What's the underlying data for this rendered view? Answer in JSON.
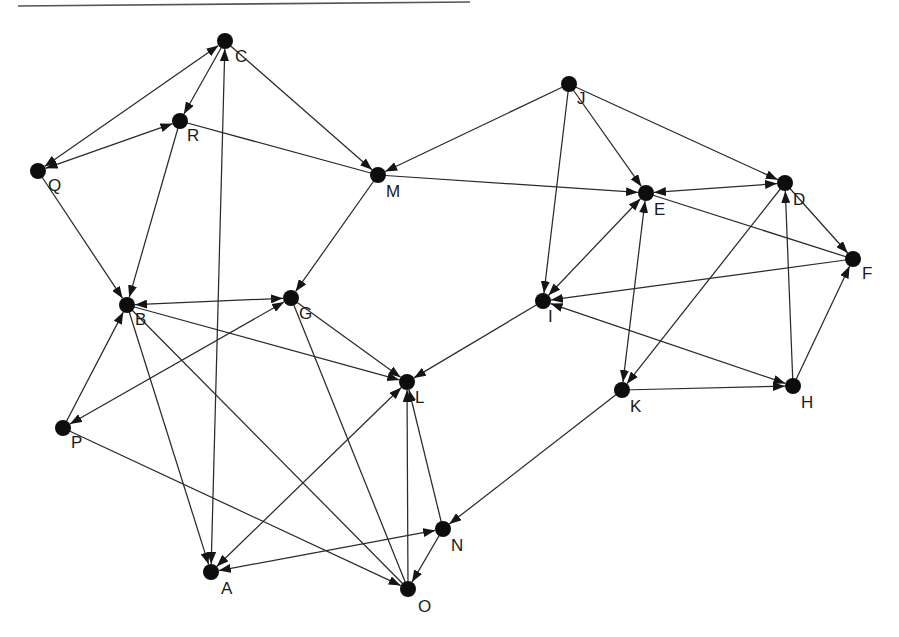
{
  "diagram": {
    "type": "directed-graph",
    "node_radius": 8,
    "colors": {
      "node": "#0d0d0d",
      "edge": "#2a2a2a",
      "label": "#1a1a1a",
      "background": "#ffffff"
    },
    "nodes": [
      {
        "id": "A",
        "label": "A",
        "x": 211,
        "y": 572,
        "lx": 221,
        "ly": 594
      },
      {
        "id": "B",
        "label": "B",
        "x": 127,
        "y": 305,
        "lx": 135,
        "ly": 325
      },
      {
        "id": "C",
        "label": "C",
        "x": 225,
        "y": 41,
        "lx": 235,
        "ly": 62
      },
      {
        "id": "D",
        "label": "D",
        "x": 785,
        "y": 183,
        "lx": 793,
        "ly": 205
      },
      {
        "id": "E",
        "label": "E",
        "x": 646,
        "y": 193,
        "lx": 654,
        "ly": 215
      },
      {
        "id": "F",
        "label": "F",
        "x": 853,
        "y": 259,
        "lx": 862,
        "ly": 279
      },
      {
        "id": "G",
        "label": "G",
        "x": 291,
        "y": 298,
        "lx": 299,
        "ly": 319
      },
      {
        "id": "H",
        "label": "H",
        "x": 793,
        "y": 386,
        "lx": 801,
        "ly": 408
      },
      {
        "id": "I",
        "label": "I",
        "x": 543,
        "y": 301,
        "lx": 548,
        "ly": 322
      },
      {
        "id": "J",
        "label": "J",
        "x": 569,
        "y": 84,
        "lx": 577,
        "ly": 104
      },
      {
        "id": "K",
        "label": "K",
        "x": 622,
        "y": 390,
        "lx": 630,
        "ly": 412
      },
      {
        "id": "L",
        "label": "L",
        "x": 407,
        "y": 382,
        "lx": 415,
        "ly": 403
      },
      {
        "id": "M",
        "label": "M",
        "x": 378,
        "y": 175,
        "lx": 386,
        "ly": 197
      },
      {
        "id": "N",
        "label": "N",
        "x": 443,
        "y": 529,
        "lx": 451,
        "ly": 551
      },
      {
        "id": "O",
        "label": "O",
        "x": 408,
        "y": 589,
        "lx": 418,
        "ly": 612
      },
      {
        "id": "P",
        "label": "P",
        "x": 63,
        "y": 428,
        "lx": 71,
        "ly": 448
      },
      {
        "id": "Q",
        "label": "Q",
        "x": 38,
        "y": 171,
        "lx": 48,
        "ly": 191
      },
      {
        "id": "R",
        "label": "R",
        "x": 180,
        "y": 121,
        "lx": 187,
        "ly": 141
      }
    ],
    "edges": [
      {
        "from": "C",
        "to": "Q",
        "arrow_to": true,
        "arrow_from": true
      },
      {
        "from": "C",
        "to": "R",
        "arrow_to": true,
        "arrow_from": false
      },
      {
        "from": "Q",
        "to": "R",
        "arrow_to": true,
        "arrow_from": true
      },
      {
        "from": "C",
        "to": "M",
        "arrow_to": true,
        "arrow_from": false
      },
      {
        "from": "R",
        "to": "M",
        "arrow_to": false,
        "arrow_from": false
      },
      {
        "from": "Q",
        "to": "B",
        "arrow_to": true,
        "arrow_from": false
      },
      {
        "from": "R",
        "to": "B",
        "arrow_to": true,
        "arrow_from": false
      },
      {
        "from": "A",
        "to": "C",
        "arrow_to": true,
        "arrow_from": true
      },
      {
        "from": "M",
        "to": "G",
        "arrow_to": true,
        "arrow_from": false
      },
      {
        "from": "J",
        "to": "M",
        "arrow_to": true,
        "arrow_from": false
      },
      {
        "from": "M",
        "to": "E",
        "arrow_to": true,
        "arrow_from": false
      },
      {
        "from": "J",
        "to": "E",
        "arrow_to": true,
        "arrow_from": false
      },
      {
        "from": "J",
        "to": "D",
        "arrow_to": true,
        "arrow_from": false
      },
      {
        "from": "J",
        "to": "I",
        "arrow_to": true,
        "arrow_from": false
      },
      {
        "from": "E",
        "to": "D",
        "arrow_to": true,
        "arrow_from": true
      },
      {
        "from": "E",
        "to": "F",
        "arrow_to": false,
        "arrow_from": false
      },
      {
        "from": "D",
        "to": "F",
        "arrow_to": true,
        "arrow_from": false
      },
      {
        "from": "F",
        "to": "I",
        "arrow_to": true,
        "arrow_from": false
      },
      {
        "from": "E",
        "to": "I",
        "arrow_to": true,
        "arrow_from": true
      },
      {
        "from": "E",
        "to": "K",
        "arrow_to": true,
        "arrow_from": true
      },
      {
        "from": "D",
        "to": "K",
        "arrow_to": true,
        "arrow_from": false
      },
      {
        "from": "H",
        "to": "D",
        "arrow_to": true,
        "arrow_from": false
      },
      {
        "from": "H",
        "to": "F",
        "arrow_to": true,
        "arrow_from": false
      },
      {
        "from": "K",
        "to": "H",
        "arrow_to": true,
        "arrow_from": false
      },
      {
        "from": "I",
        "to": "H",
        "arrow_to": true,
        "arrow_from": true
      },
      {
        "from": "I",
        "to": "L",
        "arrow_to": true,
        "arrow_from": false
      },
      {
        "from": "K",
        "to": "N",
        "arrow_to": true,
        "arrow_from": false
      },
      {
        "from": "B",
        "to": "G",
        "arrow_to": true,
        "arrow_from": true
      },
      {
        "from": "P",
        "to": "B",
        "arrow_to": true,
        "arrow_from": false
      },
      {
        "from": "G",
        "to": "P",
        "arrow_to": true,
        "arrow_from": true
      },
      {
        "from": "B",
        "to": "L",
        "arrow_to": true,
        "arrow_from": false
      },
      {
        "from": "G",
        "to": "L",
        "arrow_to": true,
        "arrow_from": false
      },
      {
        "from": "B",
        "to": "A",
        "arrow_to": true,
        "arrow_from": false
      },
      {
        "from": "B",
        "to": "O",
        "arrow_to": false,
        "arrow_from": false
      },
      {
        "from": "G",
        "to": "O",
        "arrow_to": false,
        "arrow_from": false
      },
      {
        "from": "A",
        "to": "L",
        "arrow_to": true,
        "arrow_from": true
      },
      {
        "from": "O",
        "to": "L",
        "arrow_to": true,
        "arrow_from": false
      },
      {
        "from": "N",
        "to": "L",
        "arrow_to": true,
        "arrow_from": false
      },
      {
        "from": "A",
        "to": "N",
        "arrow_to": true,
        "arrow_from": true
      },
      {
        "from": "N",
        "to": "O",
        "arrow_to": true,
        "arrow_from": false
      },
      {
        "from": "P",
        "to": "O",
        "arrow_to": true,
        "arrow_from": false
      }
    ]
  }
}
